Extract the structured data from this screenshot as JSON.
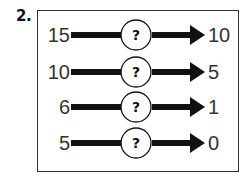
{
  "question": {
    "number": "2."
  },
  "rows": [
    {
      "input": "15",
      "operation": "?",
      "output": "10"
    },
    {
      "input": "10",
      "operation": "?",
      "output": "5"
    },
    {
      "input": "6",
      "operation": "?",
      "output": "1"
    },
    {
      "input": "5",
      "operation": "?",
      "output": "0"
    }
  ],
  "colors": {
    "arrow": "#111111",
    "text": "#333333",
    "frame": "#333333",
    "background": "#ffffff"
  },
  "icons": {
    "arrow": "right-arrow",
    "operation_circle": "circle-with-question-mark"
  }
}
